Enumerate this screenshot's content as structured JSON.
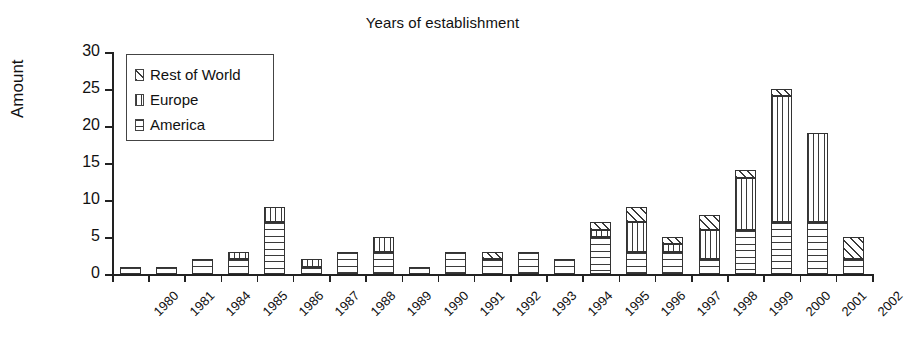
{
  "chart_data": {
    "type": "bar",
    "stacked": true,
    "title": "Years of establishment",
    "xlabel": "",
    "ylabel": "Amount",
    "ylim": [
      0,
      30
    ],
    "yticks": [
      0,
      5,
      10,
      15,
      20,
      25,
      30
    ],
    "grid": false,
    "legend_position": "top-left-inside",
    "categories": [
      "1980",
      "1981",
      "1984",
      "1985",
      "1986",
      "1987",
      "1988",
      "1989",
      "1990",
      "1991",
      "1992",
      "1993",
      "1994",
      "1995",
      "1996",
      "1997",
      "1998",
      "1999",
      "2000",
      "2001",
      "2002"
    ],
    "series": [
      {
        "name": "America",
        "pattern": "horizontal-lines",
        "values": [
          1,
          1,
          2,
          2,
          7,
          1,
          3,
          3,
          1,
          3,
          2,
          3,
          2,
          5,
          3,
          3,
          2,
          6,
          7,
          7,
          2
        ]
      },
      {
        "name": "Europe",
        "pattern": "vertical-lines",
        "values": [
          0,
          0,
          0,
          1,
          2,
          1,
          0,
          2,
          0,
          0,
          0,
          0,
          0,
          1,
          4,
          1,
          4,
          7,
          17,
          12,
          0
        ]
      },
      {
        "name": "Rest of World",
        "pattern": "diagonal-hatch",
        "values": [
          0,
          0,
          0,
          0,
          0,
          0,
          0,
          0,
          0,
          0,
          1,
          0,
          0,
          1,
          2,
          1,
          2,
          1,
          1,
          0,
          3
        ]
      }
    ],
    "totals": [
      1,
      1,
      2,
      3,
      9,
      2,
      3,
      5,
      1,
      3,
      3,
      3,
      2,
      7,
      9,
      5,
      8,
      14,
      25,
      19,
      5
    ]
  },
  "legend": {
    "items": [
      {
        "label": "Rest of World",
        "pattern": "diagonal-hatch"
      },
      {
        "label": "Europe",
        "pattern": "vertical-lines"
      },
      {
        "label": "America",
        "pattern": "horizontal-lines"
      }
    ]
  },
  "colors": {
    "ink": "#333333",
    "background": "#ffffff"
  }
}
